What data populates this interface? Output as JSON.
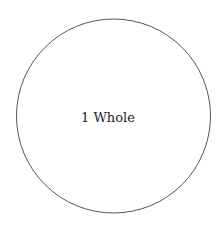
{
  "diagram": {
    "shape": "circle",
    "label": "1 Whole",
    "stroke_color": "#555555",
    "fill_color": "#ffffff",
    "text_color": "#222222"
  }
}
